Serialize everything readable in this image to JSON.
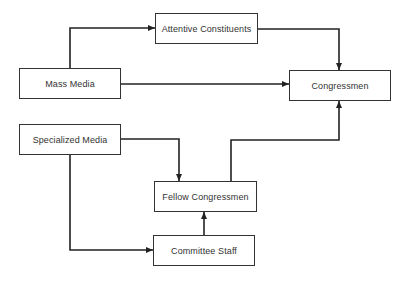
{
  "diagram": {
    "nodes": [
      {
        "id": "attentive",
        "label": "Attentive Constituents",
        "x": 155,
        "y": 13,
        "w": 103,
        "h": 31
      },
      {
        "id": "mass_media",
        "label": "Mass Media",
        "x": 19,
        "y": 68,
        "w": 102,
        "h": 31
      },
      {
        "id": "congressmen",
        "label": "Congressmen",
        "x": 289,
        "y": 70,
        "w": 102,
        "h": 31
      },
      {
        "id": "specialized",
        "label": "Specialized Media",
        "x": 19,
        "y": 124,
        "w": 102,
        "h": 31
      },
      {
        "id": "fellow",
        "label": "Fellow Congressmen",
        "x": 154,
        "y": 181,
        "w": 103,
        "h": 31
      },
      {
        "id": "staff",
        "label": "Committee Staff",
        "x": 153,
        "y": 235,
        "w": 102,
        "h": 31
      }
    ],
    "edges": [
      {
        "from": "mass_media",
        "to": "attentive",
        "points": [
          [
            70,
            68
          ],
          [
            70,
            28
          ],
          [
            155,
            28
          ]
        ]
      },
      {
        "from": "attentive",
        "to": "congressmen",
        "points": [
          [
            258,
            29
          ],
          [
            339,
            29
          ],
          [
            339,
            70
          ]
        ]
      },
      {
        "from": "mass_media",
        "to": "congressmen",
        "points": [
          [
            121,
            84
          ],
          [
            289,
            84
          ]
        ]
      },
      {
        "from": "specialized",
        "to": "fellow",
        "points": [
          [
            121,
            139
          ],
          [
            179,
            139
          ],
          [
            179,
            181
          ]
        ]
      },
      {
        "from": "specialized",
        "to": "staff",
        "points": [
          [
            70,
            155
          ],
          [
            70,
            250
          ],
          [
            153,
            250
          ]
        ]
      },
      {
        "from": "staff",
        "to": "fellow",
        "points": [
          [
            204,
            235
          ],
          [
            204,
            212
          ]
        ]
      },
      {
        "from": "fellow",
        "to": "congressmen",
        "points": [
          [
            231,
            181
          ],
          [
            231,
            140
          ],
          [
            339,
            140
          ],
          [
            339,
            101
          ]
        ]
      }
    ],
    "colors": {
      "line": "#222222",
      "border": "#333333",
      "text": "#333333",
      "background": "#ffffff"
    }
  }
}
